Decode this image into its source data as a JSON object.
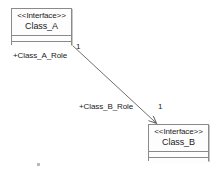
{
  "diagram": {
    "type": "uml-class-diagram",
    "canvas": {
      "width": 223,
      "height": 175,
      "background": "#ffffff"
    },
    "style": {
      "box_border": "#8a8a8a",
      "box_fill": "#fdfdfd",
      "box_shadow": "#c8c8c8",
      "line_color": "#6f6f6f",
      "text_color": "#1a1a1a"
    },
    "classes": [
      {
        "id": "class_a",
        "stereotype": "<<Interface>>",
        "name": "Class_A",
        "x": 11,
        "y": 8,
        "width": 61,
        "height": 37,
        "compartments": [
          "",
          ""
        ]
      },
      {
        "id": "class_b",
        "stereotype": "<<Interface>>",
        "name": "Class_B",
        "x": 148,
        "y": 124,
        "width": 61,
        "height": 37,
        "compartments": [
          "",
          ""
        ]
      }
    ],
    "association": {
      "kind": "directed-association",
      "from": "class_a",
      "to": "class_b",
      "from_point": {
        "x": 72,
        "y": 45
      },
      "to_point": {
        "x": 157,
        "y": 124
      },
      "source_role": "+Class_A_Role",
      "source_multiplicity": "1",
      "target_role": "+Class_B_Role",
      "target_multiplicity": "1"
    },
    "labels": {
      "source_role": {
        "text": "+Class_A_Role",
        "x": 13,
        "y": 51
      },
      "source_multiplicity": {
        "text": "1",
        "x": 76,
        "y": 42
      },
      "target_role": {
        "text": "+Class_B_Role",
        "x": 79,
        "y": 102
      },
      "target_multiplicity": {
        "text": "1",
        "x": 158,
        "y": 102
      }
    },
    "artifacts": [
      {
        "name": "stray-speck",
        "x": 37,
        "y": 163
      }
    ]
  }
}
